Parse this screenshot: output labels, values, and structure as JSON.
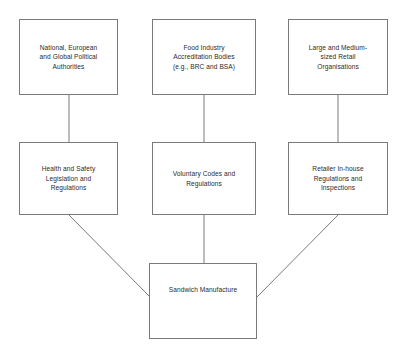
{
  "diagram": {
    "stroke_color": "#7a7a7a",
    "text_color": "#2b2b2b",
    "background_color": "#ffffff",
    "nodes": {
      "political_authorities": {
        "label": "National, European\nand Global Political\nAuthorities"
      },
      "accreditation_bodies": {
        "label": "Food Industry\nAccreditation Bodies\n(e.g., BRC and BSA)"
      },
      "retail_organisations": {
        "label": "Large and Medium-\nsized Retail\nOrganisations"
      },
      "health_safety_legislation": {
        "label": "Health and Safety\nLegislation and\nRegulations"
      },
      "voluntary_codes": {
        "label": "Voluntary Codes and\nRegulations"
      },
      "retailer_inhouse": {
        "label": "Retailer In-house\nRegulations and\nInspections"
      },
      "sandwich_manufacture": {
        "label": "Sandwich Manufacture"
      }
    },
    "edges": [
      {
        "from": "political_authorities",
        "to": "health_safety_legislation",
        "style": "vertical"
      },
      {
        "from": "accreditation_bodies",
        "to": "voluntary_codes",
        "style": "vertical"
      },
      {
        "from": "retail_organisations",
        "to": "retailer_inhouse",
        "style": "vertical"
      },
      {
        "from": "health_safety_legislation",
        "to": "sandwich_manufacture",
        "style": "diagonal"
      },
      {
        "from": "voluntary_codes",
        "to": "sandwich_manufacture",
        "style": "vertical"
      },
      {
        "from": "retailer_inhouse",
        "to": "sandwich_manufacture",
        "style": "diagonal"
      }
    ]
  }
}
